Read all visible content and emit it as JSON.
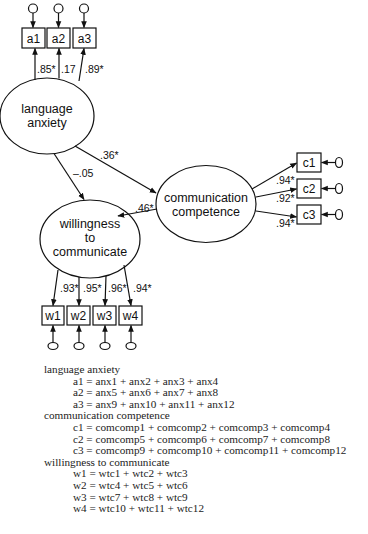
{
  "diagram": {
    "latent": {
      "language_anxiety": {
        "line1": "language",
        "line2": "anxiety"
      },
      "communication_competence": {
        "line1": "communication",
        "line2": "competence"
      },
      "willingness_to_communicate": {
        "line1": "willingness",
        "line2": "to",
        "line3": "communicate"
      }
    },
    "indicators": {
      "a": [
        "a1",
        "a2",
        "a3"
      ],
      "c": [
        "c1",
        "c2",
        "c3"
      ],
      "w": [
        "w1",
        "w2",
        "w3",
        "w4"
      ]
    },
    "loadings": {
      "a": [
        ".85*",
        ".17",
        ".89*"
      ],
      "c": [
        ".94*",
        ".92*",
        ".94*"
      ],
      "w": [
        ".93*",
        ".95*",
        ".96*",
        ".94*"
      ]
    },
    "paths": {
      "la_to_cc": ".36*",
      "la_to_wtc": "–.05",
      "cc_to_wtc": ".46*"
    }
  },
  "legend": {
    "groups": [
      {
        "title": "language anxiety",
        "items": [
          "a1 = anx1 + anx2 + anx3 + anx4",
          "a2 = anx5 + anx6 + anx7 + anx8",
          "a3 = anx9 + anx10 + anx11 + anx12"
        ]
      },
      {
        "title": "communication competence",
        "items": [
          "c1 = comcomp1 + comcomp2 + comcomp3 + comcomp4",
          "c2 = comcomp5 + comcomp6 + comcomp7 + comcomp8",
          "c3 = comcomp9 + comcomp10 + comcomp11 + comcomp12"
        ]
      },
      {
        "title": "willingness to communicate",
        "items": [
          "w1 = wtc1 + wtc2 + wtc3",
          "w2 = wtc4 + wtc5 + wtc6",
          "w3 = wtc7 + wtc8 + wtc9",
          "w4 = wtc10 + wtc11 + wtc12"
        ]
      }
    ]
  }
}
